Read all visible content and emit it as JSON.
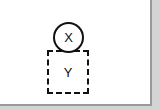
{
  "diagram": {
    "nodes": [
      {
        "id": "X",
        "label": "X",
        "shape": "circle",
        "border": "solid"
      },
      {
        "id": "Y",
        "label": "Y",
        "shape": "square",
        "border": "dashed"
      }
    ],
    "colors": {
      "stroke": "#111111",
      "background": "#ffffff",
      "frame": "#9a9a9a"
    }
  }
}
